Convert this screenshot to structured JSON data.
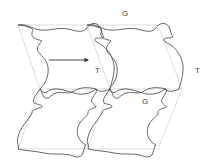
{
  "diagram": {
    "type": "tessellation",
    "labels": {
      "g_top": "G",
      "t_middle": "T",
      "t_right": "T",
      "g_lower": "G"
    },
    "colors": {
      "tile_outline": "#555555",
      "grid_line": "#cfcfcf",
      "arrow": "#333333",
      "label": "#444444"
    },
    "arrow": {
      "from": [
        49,
        60
      ],
      "to": [
        89,
        60
      ],
      "meaning": "translation"
    }
  }
}
